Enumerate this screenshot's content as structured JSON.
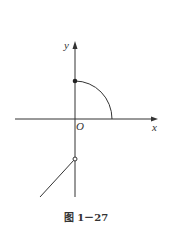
{
  "figure": {
    "caption": "图 1－27",
    "axes": {
      "x_label": "x",
      "y_label": "y",
      "origin_label": "O"
    },
    "elements": [
      {
        "type": "quarter-circle-arc",
        "description": "arc from point on positive y-axis (filled dot) to positive x-axis"
      },
      {
        "type": "filled-point",
        "description": "closed dot on positive y-axis"
      },
      {
        "type": "open-point",
        "description": "open circle on negative y-axis"
      },
      {
        "type": "ray",
        "description": "line segment extending down-left from open point"
      }
    ],
    "colors": {
      "stroke": "#333333",
      "background": "#ffffff"
    }
  }
}
